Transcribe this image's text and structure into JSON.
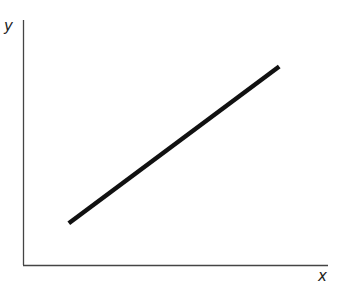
{
  "chart_data": {
    "type": "line",
    "title": "",
    "xlabel": "x",
    "ylabel": "y",
    "grid": false,
    "legend": null,
    "ticks": {
      "x": [],
      "y": []
    },
    "series": [
      {
        "name": "linear relationship",
        "points": [
          {
            "x": 0.15,
            "y": 0.17
          },
          {
            "x": 0.84,
            "y": 0.81
          }
        ],
        "color": "#111111"
      }
    ],
    "xlim": [
      0,
      1
    ],
    "ylim": [
      0,
      1
    ]
  },
  "colors": {
    "axis": "#444444",
    "line": "#111111",
    "background": "#ffffff"
  }
}
